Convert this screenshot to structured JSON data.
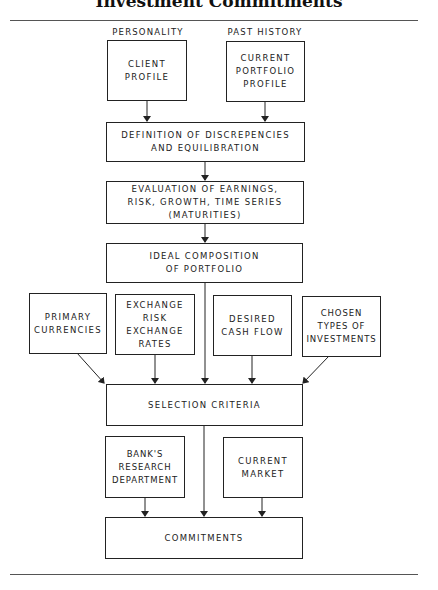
{
  "title": "Investment Commitments",
  "diagram": {
    "labels": {
      "personality": "PERSONALITY",
      "past_history": "PAST HISTORY"
    },
    "nodes": {
      "client_profile": "CLIENT\nPROFILE",
      "current_portfolio_profile": "CURRENT\nPORTFOLIO\nPROFILE",
      "definition": "DEFINITION OF DISCREPENCIES\nAND EQUILIBRATION",
      "evaluation": "EVALUATION OF EARNINGS,\nRISK, GROWTH, TIME SERIES\n(MATURITIES)",
      "ideal_composition": "IDEAL COMPOSITION\nOF PORTFOLIO",
      "primary_currencies": "PRIMARY\nCURRENCIES",
      "exchange_risk": "EXCHANGE\nRISK\nEXCHANGE\nRATES",
      "desired_cash_flow": "DESIRED\nCASH FLOW",
      "chosen_types": "CHOSEN\nTYPES OF\nINVESTMENTS",
      "selection_criteria": "SELECTION CRITERIA",
      "banks_research": "BANK'S\nRESEARCH\nDEPARTMENT",
      "current_market": "CURRENT\nMARKET",
      "commitments": "COMMITMENTS"
    },
    "edges": [
      [
        "client_profile",
        "definition"
      ],
      [
        "current_portfolio_profile",
        "definition"
      ],
      [
        "definition",
        "evaluation"
      ],
      [
        "evaluation",
        "ideal_composition"
      ],
      [
        "ideal_composition",
        "selection_criteria"
      ],
      [
        "primary_currencies",
        "selection_criteria"
      ],
      [
        "exchange_risk",
        "selection_criteria"
      ],
      [
        "desired_cash_flow",
        "selection_criteria"
      ],
      [
        "chosen_types",
        "selection_criteria"
      ],
      [
        "selection_criteria",
        "commitments"
      ],
      [
        "banks_research",
        "commitments"
      ],
      [
        "current_market",
        "commitments"
      ]
    ]
  }
}
